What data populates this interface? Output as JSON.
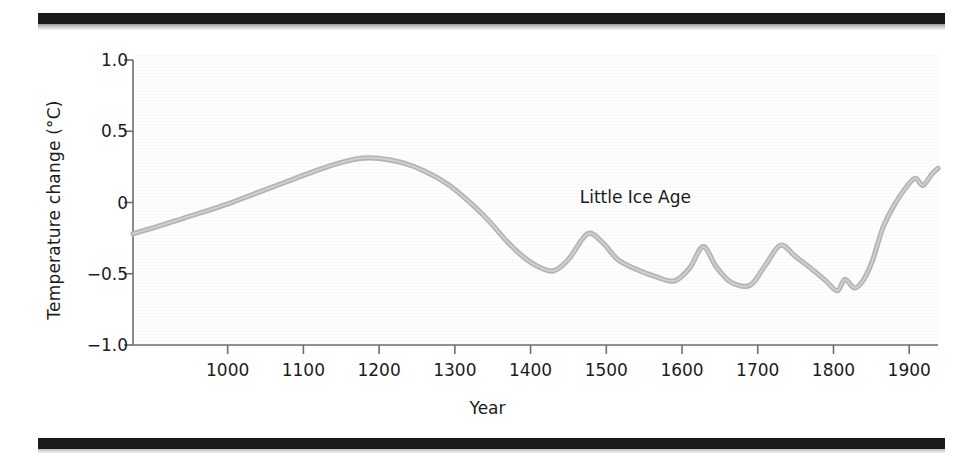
{
  "figure": {
    "background_color": "#ffffff",
    "rule_color": "#1a1a1a",
    "curve_color": "#b4b4b4"
  },
  "chart_data": {
    "type": "line",
    "title": "",
    "xlabel": "Year",
    "ylabel": "Temperature change (°C)",
    "xlim": [
      875,
      1938
    ],
    "ylim": [
      -1.0,
      1.0
    ],
    "grid": false,
    "legend": null,
    "xticks": [
      1000,
      1100,
      1200,
      1300,
      1400,
      1500,
      1600,
      1700,
      1800,
      1900
    ],
    "xtick_labels": [
      "1000",
      "1100",
      "1200",
      "1300",
      "1400",
      "1500",
      "1600",
      "1700",
      "1800",
      "1900"
    ],
    "yticks": [
      1.0,
      0.5,
      0,
      -0.5,
      -1.0
    ],
    "ytick_labels": [
      "1.0",
      "0.5",
      "0",
      "−0.5",
      "−1.0"
    ],
    "annotations": [
      {
        "text": "Little Ice Age",
        "x": 1560,
        "y": 0.03
      }
    ],
    "series": [
      {
        "name": "Temperature change",
        "color": "#b4b4b4",
        "x": [
          875,
          900,
          930,
          960,
          1000,
          1040,
          1080,
          1120,
          1150,
          1175,
          1200,
          1230,
          1260,
          1290,
          1320,
          1345,
          1370,
          1390,
          1410,
          1430,
          1450,
          1475,
          1495,
          1515,
          1540,
          1565,
          1590,
          1610,
          1628,
          1645,
          1665,
          1690,
          1710,
          1730,
          1750,
          1772,
          1790,
          1805,
          1815,
          1828,
          1840,
          1852,
          1865,
          1880,
          1895,
          1908,
          1918,
          1930,
          1938
        ],
        "y": [
          -0.22,
          -0.18,
          -0.13,
          -0.08,
          -0.01,
          0.07,
          0.15,
          0.23,
          0.28,
          0.31,
          0.31,
          0.28,
          0.22,
          0.13,
          0.0,
          -0.13,
          -0.28,
          -0.38,
          -0.45,
          -0.48,
          -0.4,
          -0.22,
          -0.28,
          -0.4,
          -0.47,
          -0.52,
          -0.55,
          -0.46,
          -0.31,
          -0.45,
          -0.56,
          -0.58,
          -0.44,
          -0.3,
          -0.38,
          -0.47,
          -0.55,
          -0.62,
          -0.54,
          -0.6,
          -0.54,
          -0.4,
          -0.18,
          -0.02,
          0.1,
          0.17,
          0.12,
          0.2,
          0.24
        ]
      }
    ]
  }
}
